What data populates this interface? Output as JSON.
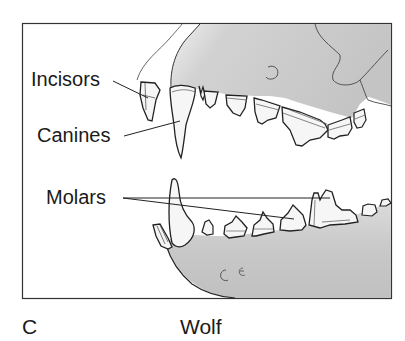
{
  "figure": {
    "panel_letter": "C",
    "species": "Wolf",
    "labels": {
      "incisors": "Incisors",
      "canines": "Canines",
      "molars": "Molars"
    },
    "colors": {
      "outline": "#222222",
      "bone_shade": "#c8c8c8",
      "bone_light": "#e4e4e4",
      "tooth_fill": "#f4f4f4",
      "background": "#ffffff"
    }
  }
}
